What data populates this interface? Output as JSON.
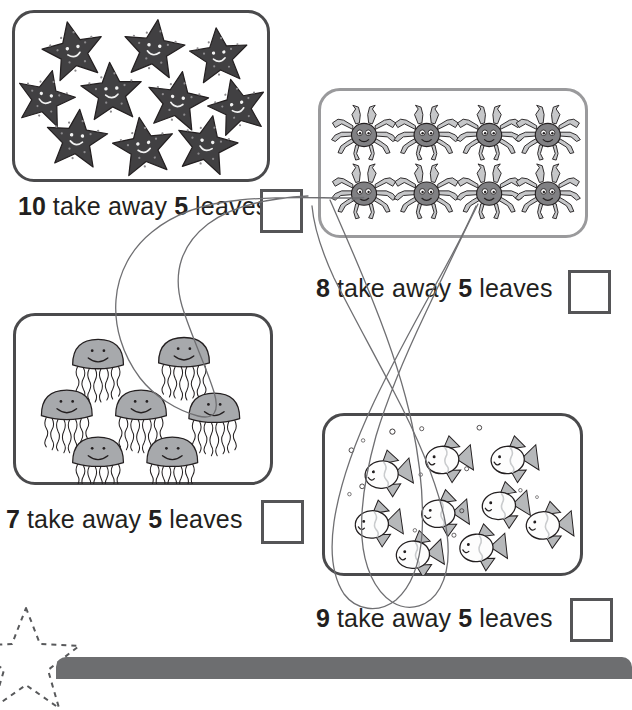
{
  "worksheet": {
    "title": "Take away 5",
    "problems": [
      {
        "id": "starfish",
        "creature": "starfish",
        "count": 10,
        "start_label": "10",
        "take_away_label": "take away",
        "subtrahend_label": "5",
        "leaves_label": "leaves",
        "answer_value": "",
        "box_border_color": "#4a4a4c"
      },
      {
        "id": "crabs",
        "creature": "crab",
        "count": 8,
        "start_label": "8",
        "take_away_label": "take away",
        "subtrahend_label": "5",
        "leaves_label": "leaves",
        "answer_value": "",
        "box_border_color": "#9a9a9c"
      },
      {
        "id": "jellyfish",
        "creature": "jellyfish",
        "count": 7,
        "start_label": "7",
        "take_away_label": "take away",
        "subtrahend_label": "5",
        "leaves_label": "leaves",
        "answer_value": "",
        "box_border_color": "#4a4a4c"
      },
      {
        "id": "fish",
        "creature": "fish",
        "count": 9,
        "start_label": "9",
        "take_away_label": "take away",
        "subtrahend_label": "5",
        "leaves_label": "leaves",
        "answer_value": "",
        "box_border_color": "#4a4a4c"
      }
    ],
    "annotations": {
      "description": "hand-drawn pencil loops crossing the page",
      "ink_color": "#6f6f72"
    },
    "footer": {
      "banner_text": "",
      "banner_color": "#6d6e70",
      "star_style": "dashed-outline"
    }
  },
  "colors": {
    "starfish_fill": "#414042",
    "starfish_dot": "#8c8a8d",
    "crab_body": "#808083",
    "crab_leg": "#c6c7c9",
    "jelly_fill": "#a7a9ac",
    "fish_fill": "#fdfdfd",
    "fish_fin": "#b6b8ba",
    "outline": "#231f20",
    "answer_box_border": "#555557"
  }
}
